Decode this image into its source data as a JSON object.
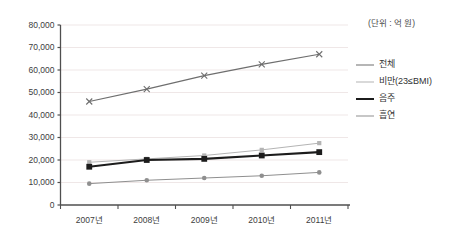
{
  "chart_data": {
    "type": "line",
    "title": "",
    "subtitle": "",
    "unit_note": "(단위 : 억 원)",
    "xlabel": "",
    "ylabel": "",
    "categories": [
      "2007년",
      "2008년",
      "2009년",
      "2010년",
      "2011년"
    ],
    "ylim": [
      0,
      80000
    ],
    "ytick_labels": [
      "80,000",
      "70,000",
      "60,000",
      "50,000",
      "40,000",
      "30,000",
      "20,000",
      "10,000",
      "0"
    ],
    "ytick_values": [
      80000,
      70000,
      60000,
      50000,
      40000,
      30000,
      20000,
      10000,
      0
    ],
    "grid": "horizontal",
    "legend_position": "right",
    "series": [
      {
        "name": "전체",
        "values": [
          46000,
          51500,
          57500,
          62500,
          67000
        ],
        "color": "#6e6e6e",
        "width": 1.1,
        "marker": "cross"
      },
      {
        "name": "비만(23≤BMI)",
        "values": [
          19000,
          20500,
          22000,
          24500,
          27500
        ],
        "color": "#b4b4b4",
        "width": 1.0,
        "marker": "square-small"
      },
      {
        "name": "음주",
        "values": [
          17000,
          20000,
          20500,
          22000,
          23500
        ],
        "color": "#1c1c1c",
        "width": 2.2,
        "marker": "square"
      },
      {
        "name": "흡연",
        "values": [
          9500,
          11000,
          12000,
          13000,
          14500
        ],
        "color": "#8f8f8f",
        "width": 1.0,
        "marker": "circle"
      }
    ]
  },
  "axis": {
    "line_color": "#4f4f4f",
    "grid_color": "#efe7e7"
  }
}
